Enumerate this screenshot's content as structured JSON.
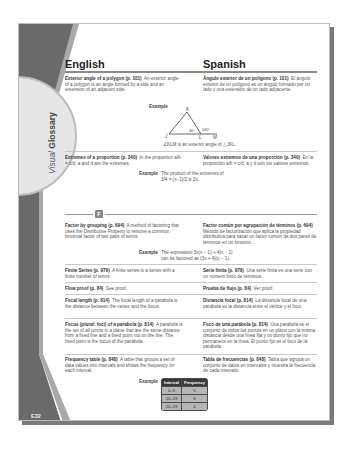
{
  "sidebar": {
    "tab_visual": "Visual",
    "tab_glossary": "Glossary",
    "page_number": "E32"
  },
  "columns": {
    "english": "English",
    "spanish": "Spanish"
  },
  "entries": [
    {
      "en_term": "Exterior angle of a polygon (p. 101)",
      "en_def": "An exterior angle of a polygon is an angle formed by a side and an extension of an adjacent side.",
      "es_term": "Ángulo exterior de un polígono (p. 101)",
      "es_def": "El ángulo exterior de un polígono es un ángulo formado por un lado y una extensión de un lado adyacente."
    },
    {
      "en_term": "Extremes of a proportion (p. 340)",
      "en_def": "In the proportion a/b = c/d, a and d are the extremes.",
      "es_term": "Valores extremos de una proporción (p. 340)",
      "es_def": "En la proporción a/b = c/d, a y d son los valores extremos."
    },
    {
      "en_term": "Factor by grouping (p. 694)",
      "en_def": "A method of factoring that uses the Distributive Property to remove a common binomial factor of two pairs of terms.",
      "es_term": "Factor común por agrupación de términos (p. 694)",
      "es_def": "Método de factorización que aplica la propiedad distributiva para sacar un factor común de dos pares de términos en un binomio."
    },
    {
      "en_term": "Finite Series (p. 979)",
      "en_def": "A finite series is a series with a finite number of terms.",
      "es_term": "Serie finita (p. 979)",
      "es_def": "Una serie finita es una serie con un número finito de términos."
    },
    {
      "en_term": "Flow proof (p. 84)",
      "en_def": "See proof.",
      "es_term": "Prueba de flujo (p. 84)",
      "es_def": "Ver proof."
    },
    {
      "en_term": "Focal length (p. 814)",
      "en_def": "The focal length of a parabola is the distance between the vertex and the focus.",
      "es_term": "Distancia focal (p. 814)",
      "es_def": "La distancia focal de una parábola es la distancia entre el vértice y el foco."
    },
    {
      "en_term": "Focus (plural: foci) of a parabola (p. 814)",
      "en_def": "A parabola is the set of all points in a plane that are the same distance from a fixed line and a fixed point not on the line. The fixed point is the focus of the parabola.",
      "es_term": "Foco de una parábola (p. 814)",
      "es_def": "Una parábola es el conjunto de todos los puntos en un plano con la misma distancia desde una línea fija y un punto fijo que no permanece en la línea. El punto fijo es el foco de la parábola."
    },
    {
      "en_term": "Frequency table (p. 848)",
      "en_def": "A table that groups a set of data values into intervals and shows the frequency for each interval.",
      "es_term": "Tabla de frecuencias (p. 848)",
      "es_def": "Tabla que agrupa un conjunto de datos en intervalos y muestra la frecuencia de cada intervalo."
    }
  ],
  "examples": {
    "label": "Example",
    "angle_caption": "∠KLM is an exterior angle of △JKL.",
    "angle_labels": {
      "k": "K",
      "j": "J",
      "l": "L",
      "m": "M",
      "a1": "40°",
      "a2": "140°"
    },
    "extremes_line1": "The product of the extremes of",
    "extremes_line2": "3/4 = (x−1)/2  is 2x.",
    "factor_line1": "The expression 3x(x − 1) + 4(x − 1)",
    "factor_line2": "can be factored as (3x + 4)(x − 1)."
  },
  "letter_divider": "F",
  "frequency_table": {
    "headers": [
      "Interval",
      "Frequency"
    ],
    "rows": [
      [
        "0–9",
        "5"
      ],
      [
        "10–19",
        "8"
      ],
      [
        "20–29",
        "4"
      ]
    ]
  }
}
